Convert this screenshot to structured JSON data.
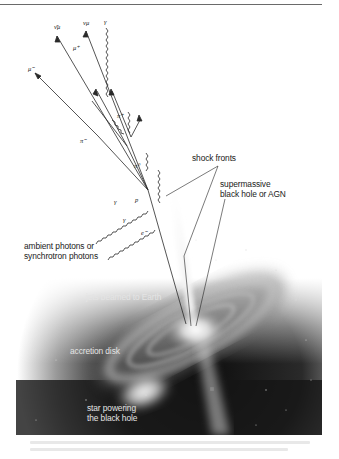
{
  "figure": {
    "labels": {
      "shock_fronts": "shock fronts",
      "smbh_line1": "supermassive",
      "smbh_line2": "black hole or AGN",
      "ambient_line1": "ambient photons or",
      "ambient_line2": "synchrotron photons",
      "jets": "jets beamed to Earth",
      "accretion": "accretion disk",
      "star_line1": "star powering",
      "star_line2": "the black hole"
    },
    "particles": {
      "anti_nu_mu": "ν̄μ",
      "nu_mu": "νμ",
      "gamma_top": "γ",
      "mu_plus": "μ⁺",
      "mu_minus": "μ⁻",
      "pi_plus_upper": "π⁺",
      "pi_minus": "π⁻",
      "pi_zero": "π⁰",
      "proton": "p",
      "gamma_left": "γ",
      "gamma_lower": "γ",
      "electron": "e⁻"
    },
    "colors": {
      "background": "#ffffff",
      "space": "#141414",
      "lines": "#2a2a2a",
      "light_text": "#e4e4e4"
    }
  }
}
